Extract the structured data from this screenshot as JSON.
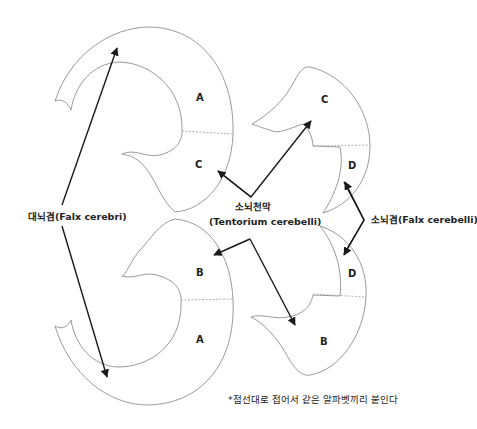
{
  "diagram": {
    "pieces": [
      {
        "id": "left-top",
        "letters": [
          "A",
          "C"
        ]
      },
      {
        "id": "left-bottom",
        "letters": [
          "B",
          "A"
        ]
      },
      {
        "id": "right-top",
        "letters": [
          "C",
          "D"
        ]
      },
      {
        "id": "right-bottom",
        "letters": [
          "D",
          "B"
        ]
      }
    ],
    "letters": {
      "lt_a": "A",
      "lt_c": "C",
      "lb_b": "B",
      "lb_a": "A",
      "rt_c": "C",
      "rt_d": "D",
      "rb_d": "D",
      "rb_b": "B"
    },
    "labels": {
      "falx_cerebri": "대뇌겸(Falx cerebri)",
      "tentorium_ko": "소뇌천막",
      "tentorium_en": "(Tentorium cerebelli)",
      "falx_cerebelli": "소뇌겸(Falx cerebelli)"
    },
    "note": "*점선대로 접어서 같은 알파벳끼리 붙인다",
    "colors": {
      "outline": "#9a9a9a",
      "fold_line": "#b0b0b0",
      "arrow": "#1a1a1a",
      "text": "#222222",
      "background": "#ffffff"
    }
  }
}
